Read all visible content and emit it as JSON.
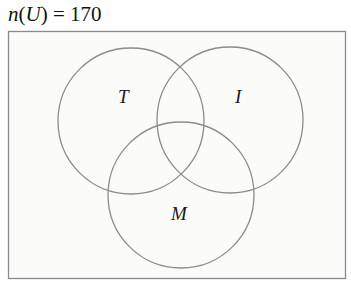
{
  "title": {
    "func": "n",
    "open_paren": "(",
    "set": "U",
    "close_paren": ")",
    "equals": " = ",
    "value": "170"
  },
  "venn": {
    "universe": {
      "label": "U",
      "cardinality": 170
    },
    "sets": [
      {
        "id": "T",
        "label": "T"
      },
      {
        "id": "I",
        "label": "I"
      },
      {
        "id": "M",
        "label": "M"
      }
    ],
    "colors": {
      "outline": "#8c8c8c",
      "text": "#1a1a1a",
      "background": "#fbfbfa"
    }
  }
}
